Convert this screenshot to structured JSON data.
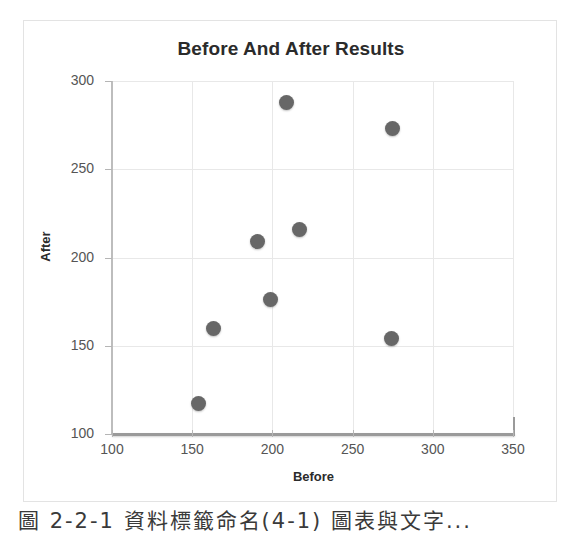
{
  "chart_data": {
    "type": "scatter",
    "title": "Before And After Results",
    "xlabel": "Before",
    "ylabel": "After",
    "xlim": [
      100,
      350
    ],
    "ylim": [
      100,
      300
    ],
    "xticks": [
      "100",
      "150",
      "200",
      "250",
      "300",
      "350"
    ],
    "yticks": [
      "100",
      "150",
      "200",
      "250",
      "300"
    ],
    "grid": true,
    "legend": "none",
    "marker_color": "#676767",
    "points": [
      {
        "x": 209,
        "y": 288
      },
      {
        "x": 275,
        "y": 273
      },
      {
        "x": 217,
        "y": 216
      },
      {
        "x": 191,
        "y": 209
      },
      {
        "x": 199,
        "y": 176
      },
      {
        "x": 163,
        "y": 160
      },
      {
        "x": 274,
        "y": 154
      },
      {
        "x": 154,
        "y": 117
      }
    ]
  },
  "caption": {
    "text": "圖 2-2-1 資料標籤命名(4-1) 圖表與文字..."
  }
}
